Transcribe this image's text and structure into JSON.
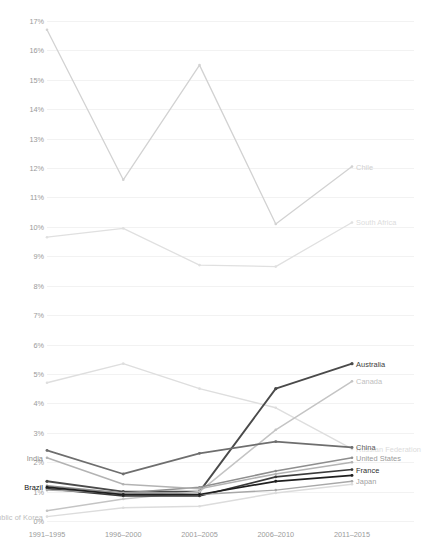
{
  "chart_data": {
    "type": "line",
    "title": "",
    "subtitle": "",
    "xlabel": "",
    "ylabel": "Share of country's patents",
    "categories": [
      "1991–1995",
      "1996–2000",
      "2001–2005",
      "2006–2010",
      "2011–2015"
    ],
    "ylim": [
      0,
      17
    ],
    "ytick_values": [
      0,
      1,
      2,
      3,
      4,
      5,
      6,
      7,
      8,
      9,
      10,
      11,
      12,
      13,
      14,
      15,
      16,
      17
    ],
    "ytick_labels": [
      "0%",
      "1%",
      "2%",
      "3%",
      "4%",
      "5%",
      "6%",
      "7%",
      "8%",
      "9%",
      "10%",
      "11%",
      "12%",
      "13%",
      "14%",
      "15%",
      "16%",
      "17%"
    ],
    "grid": true,
    "grid_color": "#f2f2f2",
    "legend_position": "inline-right",
    "markers": true,
    "series": [
      {
        "name": "Chile",
        "color": "#d2d2d2",
        "width": 1.3,
        "label_side": "right",
        "label_color": "#cfcfcf",
        "values": [
          16.7,
          11.6,
          15.5,
          10.1,
          12.05
        ]
      },
      {
        "name": "South Africa",
        "color": "#e0e0e0",
        "width": 1.3,
        "label_side": "right",
        "label_color": "#dcdcdc",
        "values": [
          9.65,
          9.95,
          8.7,
          8.65,
          10.15
        ]
      },
      {
        "name": "Russian Federation",
        "color": "#dedede",
        "width": 1.4,
        "label_side": "right",
        "label_color": "#dbdbdb",
        "values": [
          4.7,
          5.35,
          4.5,
          3.85,
          2.45
        ]
      },
      {
        "name": "Australia",
        "color": "#4a4a4a",
        "width": 1.9,
        "label_side": "right",
        "label_color": "#3c3c3c",
        "values": [
          1.35,
          1.0,
          1.0,
          4.5,
          5.35
        ]
      },
      {
        "name": "Canada",
        "color": "#c4c4c4",
        "width": 1.5,
        "label_side": "right",
        "label_color": "#c0c0c0",
        "values": [
          0.35,
          0.75,
          1.0,
          3.1,
          4.75
        ]
      },
      {
        "name": "China",
        "color": "#6e6e6e",
        "width": 1.7,
        "label_side": "right",
        "label_color": "#5a5a5a",
        "values": [
          2.4,
          1.6,
          2.3,
          2.7,
          2.5
        ]
      },
      {
        "name": "United States",
        "color": "#8e8e8e",
        "width": 1.5,
        "label_side": "right",
        "label_color": "#9a9a9a",
        "values": [
          1.2,
          0.95,
          1.15,
          1.7,
          2.15
        ]
      },
      {
        "name": "India",
        "color": "#b3b3b3",
        "width": 1.5,
        "label_side": "left",
        "label_color": "#8b8b8b",
        "values": [
          2.15,
          1.25,
          1.1,
          1.6,
          2.0
        ]
      },
      {
        "name": "France",
        "color": "#3a3a3a",
        "width": 1.6,
        "label_side": "right",
        "label_color": "#2e2e2e",
        "values": [
          1.1,
          0.85,
          0.85,
          1.5,
          1.75
        ]
      },
      {
        "name": "Japan",
        "color": "#a8a8a8",
        "width": 1.4,
        "label_side": "right",
        "label_color": "#a0a0a0",
        "values": [
          1.05,
          0.95,
          0.9,
          1.05,
          1.35
        ]
      },
      {
        "name": "Brazil",
        "color": "#1f1f1f",
        "width": 1.7,
        "label_side": "left",
        "label_color": "#111111",
        "values": [
          1.15,
          0.9,
          0.9,
          1.35,
          1.55
        ]
      },
      {
        "name": "Republic of Korea",
        "color": "#dcdcdc",
        "width": 1.4,
        "label_side": "left",
        "label_color": "#bdbdbd",
        "values": [
          0.15,
          0.45,
          0.5,
          0.95,
          1.25
        ]
      }
    ]
  }
}
